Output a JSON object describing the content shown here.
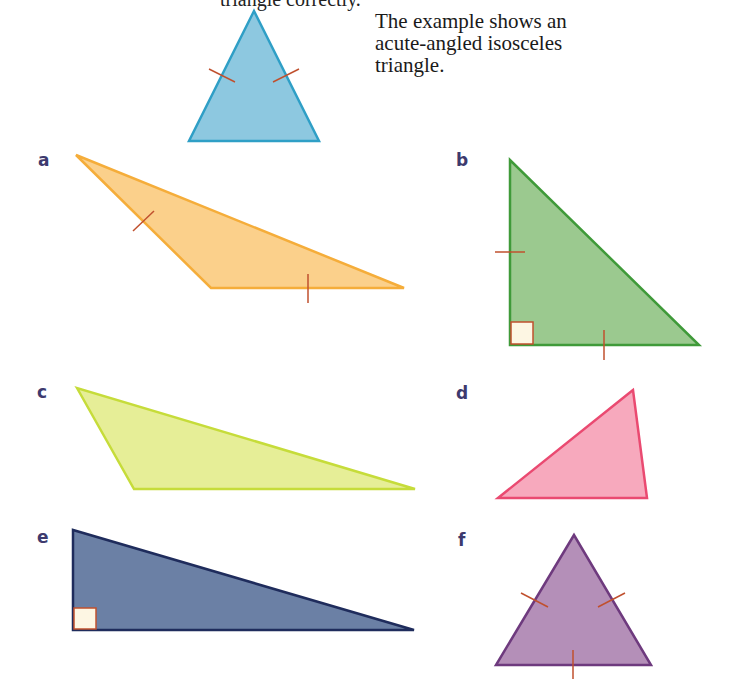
{
  "caption": {
    "lines": [
      "The example shows an",
      "acute-angled isosceles",
      "triangle."
    ]
  },
  "top_cut_text": "triangle correctly.",
  "labels": {
    "a": "a",
    "b": "b",
    "c": "c",
    "d": "d",
    "e": "e",
    "f": "f"
  },
  "triangles": [
    {
      "id": "example",
      "fill": "#8dc8e0",
      "stroke": "#2f9fc6",
      "type": "acute isosceles",
      "marks": 2
    },
    {
      "id": "a",
      "fill": "#fbd08b",
      "stroke": "#f5ad3a",
      "type": "obtuse isosceles",
      "marks": 2
    },
    {
      "id": "b",
      "fill": "#9bc98f",
      "stroke": "#3f9a39",
      "type": "right isosceles",
      "marks": 2,
      "right_angle": true
    },
    {
      "id": "c",
      "fill": "#e6ee97",
      "stroke": "#c6dc3a",
      "type": "obtuse scalene",
      "marks": 0
    },
    {
      "id": "d",
      "fill": "#f7a9bd",
      "stroke": "#ea4a71",
      "type": "acute scalene",
      "marks": 0
    },
    {
      "id": "e",
      "fill": "#6b80a5",
      "stroke": "#1f2c5c",
      "type": "right scalene",
      "marks": 0,
      "right_angle": true
    },
    {
      "id": "f",
      "fill": "#b48fb8",
      "stroke": "#6e3a7e",
      "type": "equilateral",
      "marks": 3
    }
  ],
  "colors": {
    "tick_mark": "#c0502e",
    "right_angle_fill": "#fdf6e3",
    "label": "#3d3a6e"
  }
}
